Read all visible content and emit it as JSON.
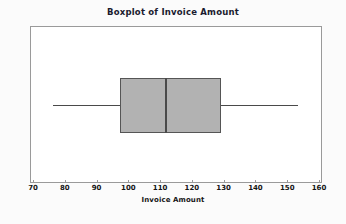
{
  "chart": {
    "title": "Boxplot of Invoice Amount",
    "xlabel": "Invoice Amount"
  },
  "chart_data": {
    "type": "box",
    "orientation": "horizontal",
    "title": "Boxplot of Invoice Amount",
    "xlabel": "Invoice Amount",
    "ylabel": "",
    "xlim": [
      70,
      160
    ],
    "xticks": [
      70,
      80,
      90,
      100,
      110,
      120,
      130,
      140,
      150,
      160
    ],
    "xticklabels": [
      "70",
      "80",
      "90",
      "100",
      "110",
      "120",
      "130",
      "140",
      "150",
      "160"
    ],
    "grid": false,
    "legend": false,
    "series": [
      {
        "name": "Invoice Amount",
        "whisker_low": 76,
        "q1": 97,
        "median": 111.5,
        "q3": 129,
        "whisker_high": 153,
        "outliers": [],
        "box_fill": "#b2b2b2",
        "box_edge": "#555555"
      }
    ]
  },
  "style": {
    "figure_background": "#fbfbfb",
    "plot_background": "#ffffff",
    "frame_color": "#9a9a9a",
    "line_color": "#4a4a4a",
    "text_color": "#151515",
    "title_color": "#1a1a2e"
  }
}
